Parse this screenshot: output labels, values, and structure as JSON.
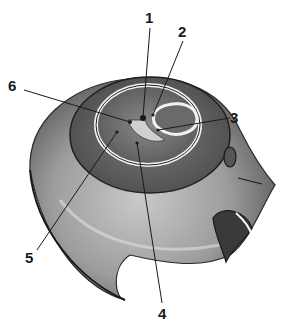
{
  "figure": {
    "style": "grayscale pencil shading",
    "colors": {
      "background": "#ffffff",
      "line": "#1a1a1a",
      "shade_dark": "#3a3a3a",
      "shade_mid": "#8a8a8a",
      "shade_light": "#d8d8d8"
    }
  },
  "labels": [
    {
      "id": "1",
      "text": "1",
      "x": 145,
      "y": 10,
      "line": [
        150,
        28,
        143,
        117
      ]
    },
    {
      "id": "2",
      "text": "2",
      "x": 178,
      "y": 24,
      "line": [
        183,
        41,
        153,
        115
      ]
    },
    {
      "id": "3",
      "text": "3",
      "x": 230,
      "y": 110,
      "line": [
        230,
        118,
        158,
        130
      ]
    },
    {
      "id": "4",
      "text": "4",
      "x": 158,
      "y": 306,
      "line": [
        162,
        303,
        137,
        143
      ]
    },
    {
      "id": "5",
      "text": "5",
      "x": 25,
      "y": 250,
      "line": [
        37,
        250,
        117,
        132
      ]
    },
    {
      "id": "6",
      "text": "6",
      "x": 8,
      "y": 78,
      "line": [
        24,
        90,
        130,
        122
      ]
    }
  ]
}
